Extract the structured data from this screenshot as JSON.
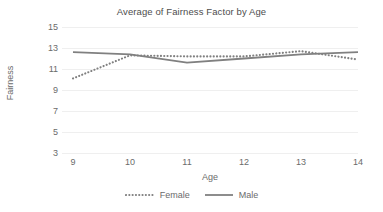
{
  "chart_data": {
    "type": "line",
    "title": "Average of Fairness Factor by Age",
    "xlabel": "Age",
    "ylabel": "Fairness",
    "categories": [
      "9",
      "10",
      "11",
      "12",
      "13",
      "14"
    ],
    "x": [
      9,
      10,
      11,
      12,
      13,
      14
    ],
    "series": [
      {
        "name": "Female",
        "values": [
          10.1,
          12.3,
          12.2,
          12.2,
          12.7,
          11.9
        ],
        "style": "dotted",
        "color": "#808080"
      },
      {
        "name": "Male",
        "values": [
          12.6,
          12.4,
          11.6,
          12.0,
          12.4,
          12.6
        ],
        "style": "solid",
        "color": "#808080"
      }
    ],
    "ylim": [
      3,
      15
    ],
    "yticks": [
      15,
      13,
      11,
      9,
      7,
      5,
      3
    ],
    "ytick_labels": [
      "15",
      "13",
      "11",
      "9",
      "7",
      "5",
      "3"
    ],
    "grid": true,
    "grid_color": "#efefef",
    "legend_position": "bottom",
    "background": "#ffffff"
  }
}
